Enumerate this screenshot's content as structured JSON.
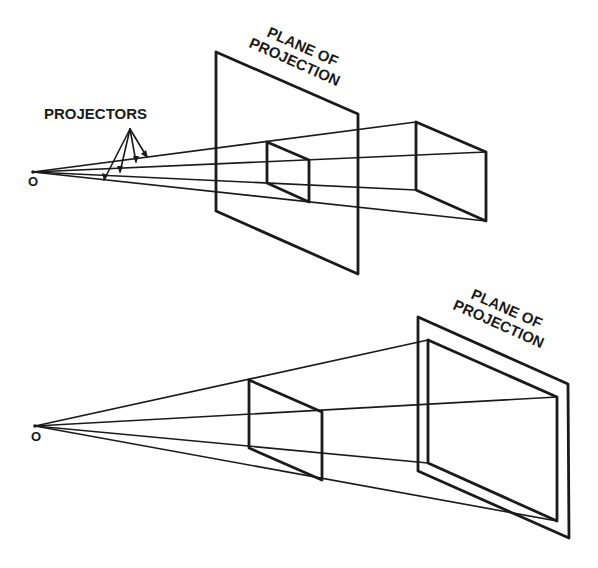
{
  "diagrams": [
    {
      "id": "plane-between-eye-and-object",
      "origin_label": "O",
      "projectors_label": "PROJECTORS",
      "plane_label_line1": "PLANE OF",
      "plane_label_line2": "PROJECTION"
    },
    {
      "id": "plane-behind-object",
      "origin_label": "O",
      "plane_label_line1": "PLANE OF",
      "plane_label_line2": "PROJECTION"
    }
  ],
  "colors": {
    "line": "#1a1a1a",
    "background": "#ffffff"
  }
}
